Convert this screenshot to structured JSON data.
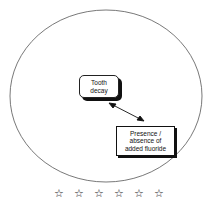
{
  "diagram": {
    "nodes": [
      {
        "id": "tooth",
        "label": "Tooth decay"
      },
      {
        "id": "fluoride",
        "label": "Presence / absence of added fluoride"
      }
    ],
    "edges": [
      {
        "from": "tooth",
        "to": "fluoride",
        "type": "bidirectional-arrow"
      }
    ],
    "rating": {
      "stars": [
        "☆",
        "☆",
        "☆",
        "☆",
        "☆",
        "☆"
      ]
    }
  }
}
